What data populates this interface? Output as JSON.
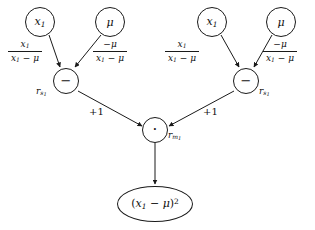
{
  "diagram": {
    "type": "computational-graph",
    "stroke_color": "#1a1a1a",
    "text_color": "#111111",
    "background_color": "#ffffff",
    "nodes": [
      {
        "id": "x1_left",
        "kind": "variable",
        "shape": "circle",
        "label": "x",
        "sub": "1",
        "cx": 40,
        "cy": 22
      },
      {
        "id": "mu_left",
        "kind": "variable",
        "shape": "circle",
        "label": "μ",
        "sub": "",
        "cx": 110,
        "cy": 22
      },
      {
        "id": "x1_right",
        "kind": "variable",
        "shape": "circle",
        "label": "x",
        "sub": "1",
        "cx": 212,
        "cy": 22
      },
      {
        "id": "mu_right",
        "kind": "variable",
        "shape": "circle",
        "label": "μ",
        "sub": "",
        "cx": 281,
        "cy": 22
      },
      {
        "id": "sub_left",
        "kind": "operator",
        "shape": "circle",
        "label": "−",
        "sub": "",
        "cx": 66,
        "cy": 81,
        "node_label": "r",
        "node_label_sub": "s₁"
      },
      {
        "id": "sub_right",
        "kind": "operator",
        "shape": "circle",
        "label": "−",
        "sub": "",
        "cx": 246,
        "cy": 81,
        "node_label": "r",
        "node_label_sub": "s₁"
      },
      {
        "id": "mult",
        "kind": "operator",
        "shape": "circle",
        "label": "·",
        "sub": "",
        "cx": 155,
        "cy": 130,
        "node_label": "r",
        "node_label_sub": "m₁"
      },
      {
        "id": "result",
        "kind": "result",
        "shape": "ellipse",
        "label": "(x₁ − μ)²",
        "sub": "",
        "cx": 155,
        "cy": 204
      }
    ],
    "edges": [
      {
        "from": "x1_left",
        "to": "sub_left",
        "label_num": "x₁",
        "label_den": "x₁ − μ"
      },
      {
        "from": "mu_left",
        "to": "sub_left",
        "label_num": "−μ",
        "label_den": "x₁ − μ"
      },
      {
        "from": "x1_right",
        "to": "sub_right",
        "label_num": "x₁",
        "label_den": "x₁ − μ"
      },
      {
        "from": "mu_right",
        "to": "sub_right",
        "label_num": "−μ",
        "label_den": "x₁ − μ"
      },
      {
        "from": "sub_left",
        "to": "mult",
        "label": "+1"
      },
      {
        "from": "sub_right",
        "to": "mult",
        "label": "+1"
      },
      {
        "from": "mult",
        "to": "result",
        "label": ""
      }
    ],
    "edge_labels": {
      "plus_one_left": "+1",
      "plus_one_right": "+1"
    },
    "fractions": {
      "left_x1": {
        "numerator": "x1",
        "denominator": "x1 - mu"
      },
      "left_mu": {
        "numerator": "-mu",
        "denominator": "x1 - mu"
      },
      "right_x1": {
        "numerator": "x1",
        "denominator": "x1 - mu"
      },
      "right_mu": {
        "numerator": "-mu",
        "denominator": "x1 - mu"
      }
    },
    "node_labels": {
      "r_s1_left": "r",
      "r_s1_right": "r",
      "r_m1": "r"
    },
    "subscripts": {
      "s1": "s₁",
      "m1": "m₁",
      "one": "1"
    },
    "glyphs": {
      "minus": "−",
      "dot": "·",
      "mu": "μ"
    }
  }
}
